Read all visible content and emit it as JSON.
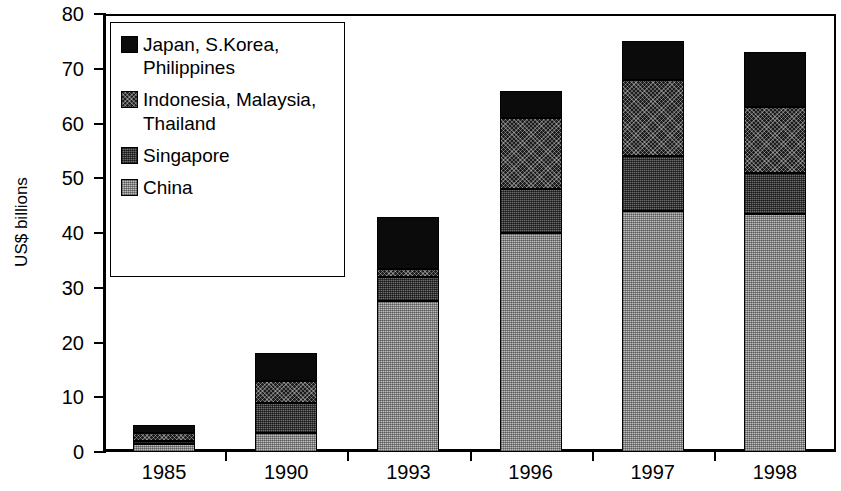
{
  "chart_data": {
    "type": "bar",
    "subtype": "stacked-vertical",
    "title": "",
    "xlabel": "",
    "ylabel": "US$ billions",
    "ylim": [
      0,
      80
    ],
    "yticks": [
      0,
      10,
      20,
      30,
      40,
      50,
      60,
      70,
      80
    ],
    "ytick_labels": [
      "0",
      "10",
      "20",
      "30",
      "40",
      "50",
      "60",
      "70",
      "80"
    ],
    "grid": false,
    "legend_position": "upper-left-inside",
    "categories": [
      "1985",
      "1990",
      "1993",
      "1996",
      "1997",
      "1998"
    ],
    "series": [
      {
        "name": "China",
        "legend_label": "China",
        "swatch": "light-gray-dotted",
        "color": "#bdbdbd",
        "values": [
          1.5,
          3.5,
          27.5,
          40,
          44,
          43.5
        ]
      },
      {
        "name": "Singapore",
        "legend_label": "Singapore",
        "swatch": "medium-gray-checker",
        "color": "#6e6e6e",
        "values": [
          0.5,
          5.5,
          4.5,
          8,
          10,
          7.5
        ]
      },
      {
        "name": "Indonesia, Malaysia, Thailand",
        "legend_label": "Indonesia, Malaysia,\nThailand",
        "swatch": "dark-crosshatch",
        "color": "#1c1c1c",
        "values": [
          1.5,
          4,
          1.5,
          13,
          14,
          12
        ]
      },
      {
        "name": "Japan, S.Korea, Philippines",
        "legend_label": "Japan, S.Korea,\nPhilippines",
        "swatch": "solid-black",
        "color": "#0b0b0b",
        "values": [
          1.5,
          5,
          9.5,
          5,
          7,
          10
        ]
      }
    ],
    "totals": [
      5,
      18,
      43,
      66,
      75,
      73
    ],
    "axis_color": "#000000"
  }
}
